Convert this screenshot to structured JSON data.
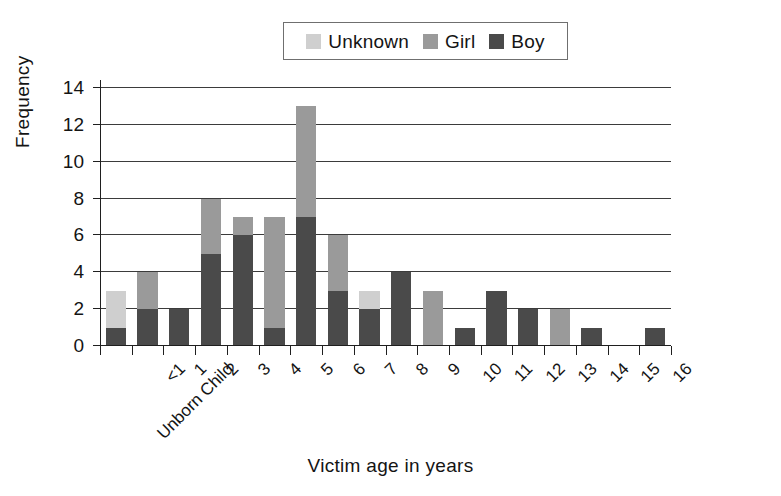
{
  "legend": {
    "position": "top-center",
    "items": [
      {
        "label": "Unknown",
        "color": "#cfcfcf",
        "swatch_name": "legend-swatch-unknown"
      },
      {
        "label": "Girl",
        "color": "#9a9a9a",
        "swatch_name": "legend-swatch-girl"
      },
      {
        "label": "Boy",
        "color": "#4a4a4a",
        "swatch_name": "legend-swatch-boy"
      }
    ]
  },
  "axes": {
    "y_title": "Frequency",
    "x_title": "Victim age in years",
    "y_ticks": [
      "0",
      "2",
      "4",
      "6",
      "8",
      "10",
      "12",
      "14"
    ],
    "y_min": 0,
    "y_max": 14,
    "grid": true
  },
  "chart_data": {
    "type": "bar",
    "stacked": true,
    "title": "",
    "xlabel": "Victim age in years",
    "ylabel": "Frequency",
    "ylim": [
      0,
      14
    ],
    "ytick_step": 2,
    "grid": true,
    "legend_position": "top-center",
    "categories": [
      "Unborn Child",
      "<1",
      "1",
      "2",
      "3",
      "4",
      "5",
      "6",
      "7",
      "8",
      "9",
      "10",
      "11",
      "12",
      "13",
      "14",
      "15",
      "16"
    ],
    "series": [
      {
        "name": "Boy",
        "color": "#4a4a4a",
        "values": [
          1,
          2,
          2,
          5,
          6,
          1,
          7,
          3,
          2,
          4,
          0,
          1,
          3,
          2,
          0,
          1,
          0,
          1
        ]
      },
      {
        "name": "Girl",
        "color": "#9a9a9a",
        "values": [
          0,
          2,
          0,
          3,
          1,
          6,
          6,
          3,
          0,
          0,
          3,
          0,
          0,
          0,
          2,
          0,
          0,
          0
        ]
      },
      {
        "name": "Unknown",
        "color": "#cfcfcf",
        "values": [
          2,
          0,
          0,
          0,
          0,
          0,
          0,
          0,
          1,
          0,
          0,
          0,
          0,
          0,
          0,
          0,
          0,
          0
        ]
      }
    ],
    "totals": [
      3,
      4,
      2,
      8,
      7,
      7,
      13,
      6,
      3,
      4,
      3,
      1,
      3,
      2,
      2,
      1,
      0,
      1
    ]
  }
}
